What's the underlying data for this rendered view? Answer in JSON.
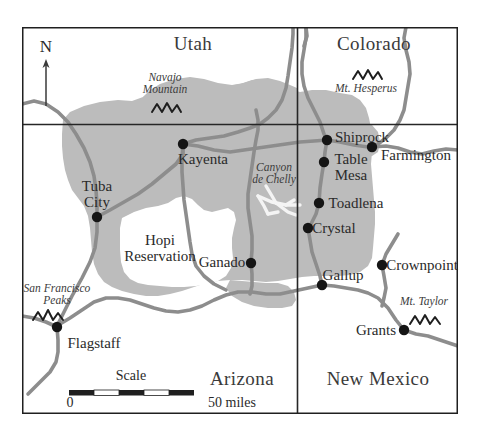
{
  "map": {
    "title": "Navajo Nation Region Map",
    "frame": {
      "x": 22,
      "y": 27,
      "width": 436,
      "height": 387
    },
    "colors": {
      "background": "#ffffff",
      "reservation_fill": "#bcbcbc",
      "road": "#8d8d8d",
      "border": "#2b2b2b",
      "text": "#2a2a2a",
      "city_dot": "#1a1a1a",
      "canyon_fill": "#f2f2f2"
    },
    "north_arrow": {
      "label": "N"
    },
    "scale_bar": {
      "title": "Scale",
      "start_label": "0",
      "end_label": "50 miles"
    },
    "states": [
      {
        "name": "Utah",
        "x": 193,
        "y": 46
      },
      {
        "name": "Colorado",
        "x": 374,
        "y": 46
      },
      {
        "name": "Arizona",
        "x": 242,
        "y": 381
      },
      {
        "name": "New Mexico",
        "x": 378,
        "y": 381
      }
    ],
    "areas": [
      {
        "name": "Hopi Reservation",
        "lines": [
          "Hopi",
          "Reservation"
        ],
        "x": 160,
        "y": 243
      }
    ],
    "features": [
      {
        "name": "Navajo Mountain",
        "lines": [
          "Navajo",
          "Mountain"
        ],
        "x": 165,
        "y": 78,
        "glyph_x": 165,
        "glyph_y": 110
      },
      {
        "name": "Mt. Hesperus",
        "lines": [
          "Mt. Hesperus"
        ],
        "x": 366,
        "y": 89,
        "glyph_x": 366,
        "glyph_y": 72
      },
      {
        "name": "Canyon de Chelly",
        "lines": [
          "Canyon",
          "de Chelly"
        ],
        "x": 274,
        "y": 168,
        "glyph_x": null,
        "glyph_y": null
      },
      {
        "name": "San Francisco Peaks",
        "lines": [
          "San Francisco",
          "Peaks"
        ],
        "x": 57,
        "y": 288,
        "glyph_x": 50,
        "glyph_y": 316
      },
      {
        "name": "Mt. Taylor",
        "lines": [
          "Mt. Taylor"
        ],
        "x": 424,
        "y": 301,
        "glyph_x": 424,
        "glyph_y": 318
      }
    ],
    "cities": [
      {
        "name": "Kayenta",
        "dot_x": 183,
        "dot_y": 144,
        "label_x": 203,
        "label_y": 159,
        "align": "center"
      },
      {
        "name": "Tuba City",
        "dot_x": 97,
        "dot_y": 217,
        "label_x": 97,
        "label_y": 186,
        "align": "center",
        "lines": [
          "Tuba",
          "City"
        ]
      },
      {
        "name": "Ganado",
        "dot_x": 251,
        "dot_y": 263,
        "label_x": 222,
        "label_y": 255,
        "align": "center"
      },
      {
        "name": "Shiprock",
        "dot_x": 327,
        "dot_y": 140,
        "label_x": 360,
        "label_y": 129,
        "align": "center"
      },
      {
        "name": "Table Mesa",
        "dot_x": 324,
        "dot_y": 162,
        "label_x": 350,
        "label_y": 152,
        "align": "center",
        "lines": [
          "Table",
          "Mesa"
        ]
      },
      {
        "name": "Farmington",
        "dot_x": 372,
        "dot_y": 147,
        "label_x": 410,
        "label_y": 156,
        "align": "center"
      },
      {
        "name": "Toadlena",
        "dot_x": 319,
        "dot_y": 203,
        "label_x": 355,
        "label_y": 203,
        "align": "center"
      },
      {
        "name": "Crystal",
        "dot_x": 308,
        "dot_y": 228,
        "label_x": 331,
        "label_y": 240,
        "align": "center"
      },
      {
        "name": "Gallup",
        "dot_x": 322,
        "dot_y": 285,
        "label_x": 340,
        "label_y": 272,
        "align": "center"
      },
      {
        "name": "Crownpoint",
        "dot_x": 382,
        "dot_y": 265,
        "label_x": 421,
        "label_y": 265,
        "align": "center"
      },
      {
        "name": "Grants",
        "dot_x": 404,
        "dot_y": 330,
        "label_x": 377,
        "label_y": 330,
        "align": "center"
      },
      {
        "name": "Flagstaff",
        "dot_x": 57,
        "dot_y": 327,
        "label_x": 92,
        "label_y": 345,
        "align": "center"
      }
    ]
  }
}
